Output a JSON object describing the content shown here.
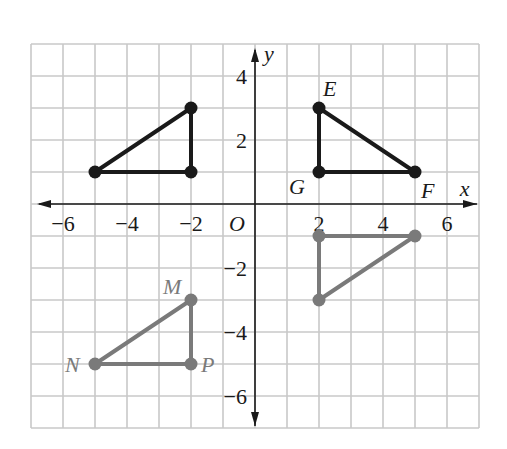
{
  "chart_data": {
    "type": "scatter",
    "title": "",
    "xlabel": "x",
    "ylabel": "y",
    "origin_label": "O",
    "xlim": [
      -7,
      7
    ],
    "ylim": [
      -7,
      5
    ],
    "grid": true,
    "x_ticks": [
      -6,
      -4,
      -2,
      2,
      4,
      6
    ],
    "y_ticks": [
      4,
      2,
      -2,
      -4,
      -6
    ],
    "x_tick_labels": [
      "−6",
      "−4",
      "−2",
      "2",
      "4",
      "6"
    ],
    "y_tick_labels": [
      "4",
      "2",
      "−2",
      "−4",
      "−6"
    ],
    "triangles": [
      {
        "name": "EFG",
        "color": "#1a1a1a",
        "vertices": [
          {
            "label": "E",
            "x": 2,
            "y": 3
          },
          {
            "label": "F",
            "x": 5,
            "y": 1
          },
          {
            "label": "G",
            "x": 2,
            "y": 1
          }
        ]
      },
      {
        "name": "unlabeled-upper-left",
        "color": "#1a1a1a",
        "vertices": [
          {
            "label": "",
            "x": -2,
            "y": 3
          },
          {
            "label": "",
            "x": -5,
            "y": 1
          },
          {
            "label": "",
            "x": -2,
            "y": 1
          }
        ]
      },
      {
        "name": "MNP",
        "color": "#7a7a7a",
        "vertices": [
          {
            "label": "M",
            "x": -2,
            "y": -3
          },
          {
            "label": "N",
            "x": -5,
            "y": -5
          },
          {
            "label": "P",
            "x": -2,
            "y": -5
          }
        ]
      },
      {
        "name": "unlabeled-lower-right",
        "color": "#7a7a7a",
        "vertices": [
          {
            "label": "",
            "x": 2,
            "y": -1
          },
          {
            "label": "",
            "x": 5,
            "y": -1
          },
          {
            "label": "",
            "x": 2,
            "y": -3
          }
        ]
      }
    ]
  },
  "colors": {
    "grid": "#c8c8c8",
    "axis": "#1a1a1a",
    "dark": "#1a1a1a",
    "gray": "#7a7a7a"
  }
}
